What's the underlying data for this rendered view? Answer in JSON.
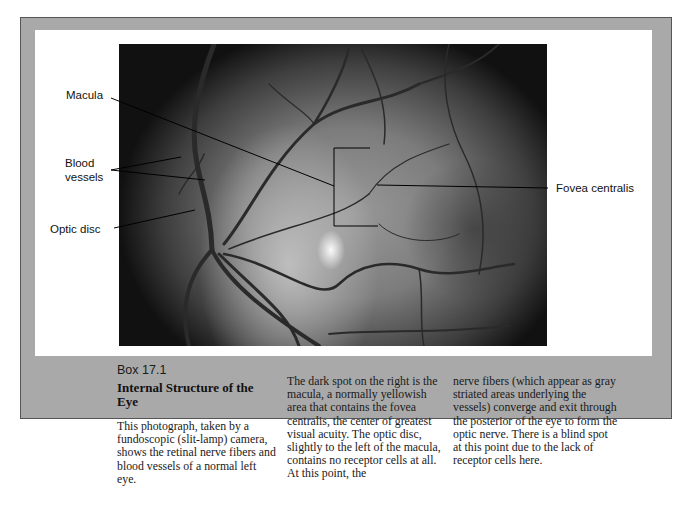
{
  "figure": {
    "labels": {
      "macula": "Macula",
      "blood_vessels_line1": "Blood",
      "blood_vessels_line2": "vessels",
      "optic_disc": "Optic disc",
      "fovea_centralis": "Fovea centralis"
    },
    "photo_description": "Fundoscopic photograph of retina of a normal left eye"
  },
  "caption": {
    "box_number": "Box 17.1",
    "title": "Internal Structure of the Eye",
    "column1": "This photograph, taken by a fundoscopic (slit-lamp) camera, shows the retinal nerve fibers and blood vessels of a normal left eye.",
    "column2": "The dark spot on the right is the macula, a normally yellowish area that contains the fovea centralis, the center of greatest visual acuity. The optic disc, slightly to the left of the macula, contains no receptor cells at all. At this point, the",
    "column3": "nerve fibers (which appear as gray striated areas underlying the vessels) converge and exit through the posterior of the eye to form the optic nerve. There is a blind spot at this point due to the lack of receptor cells here."
  },
  "colors": {
    "frame": "#a9a9a9",
    "panel": "#ffffff",
    "text": "#111111"
  }
}
